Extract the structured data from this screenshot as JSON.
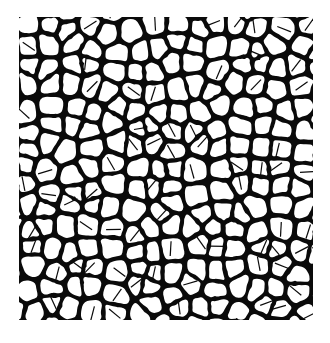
{
  "image": {
    "description": "Black and white micrograph of a cellular foam / grain structure: irregular rounded white polygonal cells separated by black boundaries.",
    "background": "#ffffff",
    "cell_color": "#ffffff",
    "boundary_color": "#0a0a0a",
    "frame": {
      "x": 19,
      "y": 17,
      "width": 294,
      "height": 303
    },
    "cells": {
      "columns": 14,
      "rows": 15,
      "seed": 7
    }
  }
}
